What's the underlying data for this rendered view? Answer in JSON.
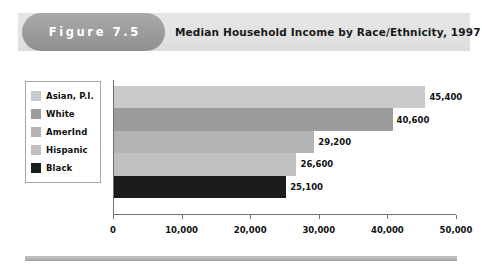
{
  "header": {
    "figure_label": "Figure 7.5",
    "title": "Median Household Income by Race/Ethnicity, 1997",
    "pill_color": "#9e9e9e",
    "band_color": "#e3e3e3"
  },
  "legend": {
    "items": [
      {
        "label": "Asian, P.I.",
        "color": "#c9c9c9"
      },
      {
        "label": "White",
        "color": "#9b9b9b"
      },
      {
        "label": "AmerInd",
        "color": "#b4b4b4"
      },
      {
        "label": "Hispanic",
        "color": "#c0c0c0"
      },
      {
        "label": "Black",
        "color": "#1c1c1c"
      }
    ]
  },
  "chart_data": {
    "type": "bar",
    "orientation": "horizontal",
    "title": "Median Household Income by Race/Ethnicity, 1997",
    "xlabel": "",
    "ylabel": "",
    "categories": [
      "Asian, P.I.",
      "White",
      "AmerInd",
      "Hispanic",
      "Black"
    ],
    "values": [
      45400,
      40600,
      29200,
      26600,
      25100
    ],
    "value_labels": [
      "45,400",
      "40,600",
      "29,200",
      "26,600",
      "25,100"
    ],
    "colors": [
      "#c9c9c9",
      "#9b9b9b",
      "#b4b4b4",
      "#c0c0c0",
      "#1c1c1c"
    ],
    "xlim": [
      0,
      50000
    ],
    "xticks": [
      0,
      10000,
      20000,
      30000,
      40000,
      50000
    ],
    "xtick_labels": [
      "0",
      "10,000",
      "20,000",
      "30,000",
      "40,000",
      "50,000"
    ],
    "grid": false,
    "legend_position": "left-outside"
  }
}
